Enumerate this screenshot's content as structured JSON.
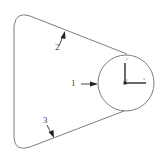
{
  "diagram": {
    "type": "mechanical-schematic",
    "colors": {
      "background": "#ffffff",
      "outline": "#6f6f6f",
      "arrows": "#222222",
      "labels": "#444444"
    },
    "labels": [
      {
        "id": "1",
        "text": "1",
        "target": "circle"
      },
      {
        "id": "2",
        "text": "2",
        "target": "upper-straight-edge"
      },
      {
        "id": "3",
        "text": "3",
        "target": "lower-straight-edge"
      }
    ],
    "axes": {
      "vertical_label": "y",
      "origin_label": "z",
      "horizontal_label": "x"
    }
  }
}
